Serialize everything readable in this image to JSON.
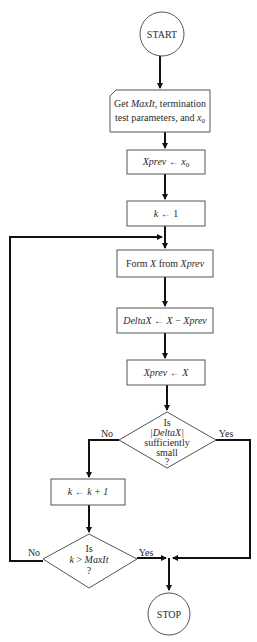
{
  "diagram": {
    "type": "flowchart",
    "nodes": {
      "start": {
        "shape": "circle",
        "label": "START"
      },
      "input": {
        "shape": "input-card",
        "line1_prefix": "Get ",
        "line1_var": "MaxIt",
        "line1_suffix": ", termination",
        "line2_prefix": "test parameters, and ",
        "line2_var": "x",
        "line2_sub": "0"
      },
      "init_xprev": {
        "shape": "rect",
        "lhs": "Xprev",
        "arrow": " ← ",
        "rhs_var": "x",
        "rhs_sub": "0"
      },
      "init_k": {
        "shape": "rect",
        "lhs": "k",
        "arrow": " ← ",
        "rhs": "1"
      },
      "form_x": {
        "shape": "rect",
        "prefix": "Form ",
        "var1": "X",
        "mid": " from ",
        "var2": "Xprev"
      },
      "delta": {
        "shape": "rect",
        "lhs": "DeltaX",
        "arrow": " ← ",
        "rhs_var1": "X",
        "op": " − ",
        "rhs_var2": "Xprev"
      },
      "update_xprev": {
        "shape": "rect",
        "lhs": "Xprev",
        "arrow": " ← ",
        "rhs": "X"
      },
      "decision_small": {
        "shape": "diamond",
        "line1": "Is",
        "line2": "|DeltaX|",
        "line3": "sufficiently",
        "line4": "small",
        "line5": "?",
        "no_label": "No",
        "yes_label": "Yes"
      },
      "increment_k": {
        "shape": "rect",
        "lhs": "k",
        "arrow": " ← ",
        "rhs": "k + 1"
      },
      "decision_max": {
        "shape": "diamond",
        "line1": "Is",
        "line2_var1": "k",
        "line2_op": " > ",
        "line2_var2": "MaxIt",
        "line3": "?",
        "no_label": "No",
        "yes_label": "Yes"
      },
      "stop": {
        "shape": "circle",
        "label": "STOP"
      }
    },
    "edges": [
      {
        "from": "start",
        "to": "input"
      },
      {
        "from": "input",
        "to": "init_xprev"
      },
      {
        "from": "init_xprev",
        "to": "init_k"
      },
      {
        "from": "init_k",
        "to": "form_x"
      },
      {
        "from": "form_x",
        "to": "delta"
      },
      {
        "from": "delta",
        "to": "update_xprev"
      },
      {
        "from": "update_xprev",
        "to": "decision_small"
      },
      {
        "from": "decision_small",
        "to": "increment_k",
        "label": "No"
      },
      {
        "from": "decision_small",
        "to": "stop",
        "label": "Yes"
      },
      {
        "from": "increment_k",
        "to": "decision_max"
      },
      {
        "from": "decision_max",
        "to": "form_x",
        "label": "No"
      },
      {
        "from": "decision_max",
        "to": "stop",
        "label": "Yes"
      }
    ]
  }
}
